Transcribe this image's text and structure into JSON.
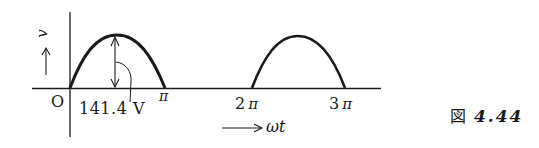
{
  "figure": {
    "type": "half-wave rectified sine waveform",
    "y_axis_label": "v",
    "x_axis_label": "ωt",
    "origin_label": "O",
    "peak_annotation": "141.4 V",
    "x_ticks": [
      {
        "label": "π",
        "position": "pi"
      },
      {
        "label": "2",
        "symbol": "π",
        "position": "2pi"
      },
      {
        "label": "3",
        "symbol": "π",
        "position": "3pi"
      }
    ],
    "caption": {
      "prefix": "図",
      "number": "4.44"
    },
    "colors": {
      "stroke": "#1a1a1a",
      "background": "#ffffff"
    }
  }
}
